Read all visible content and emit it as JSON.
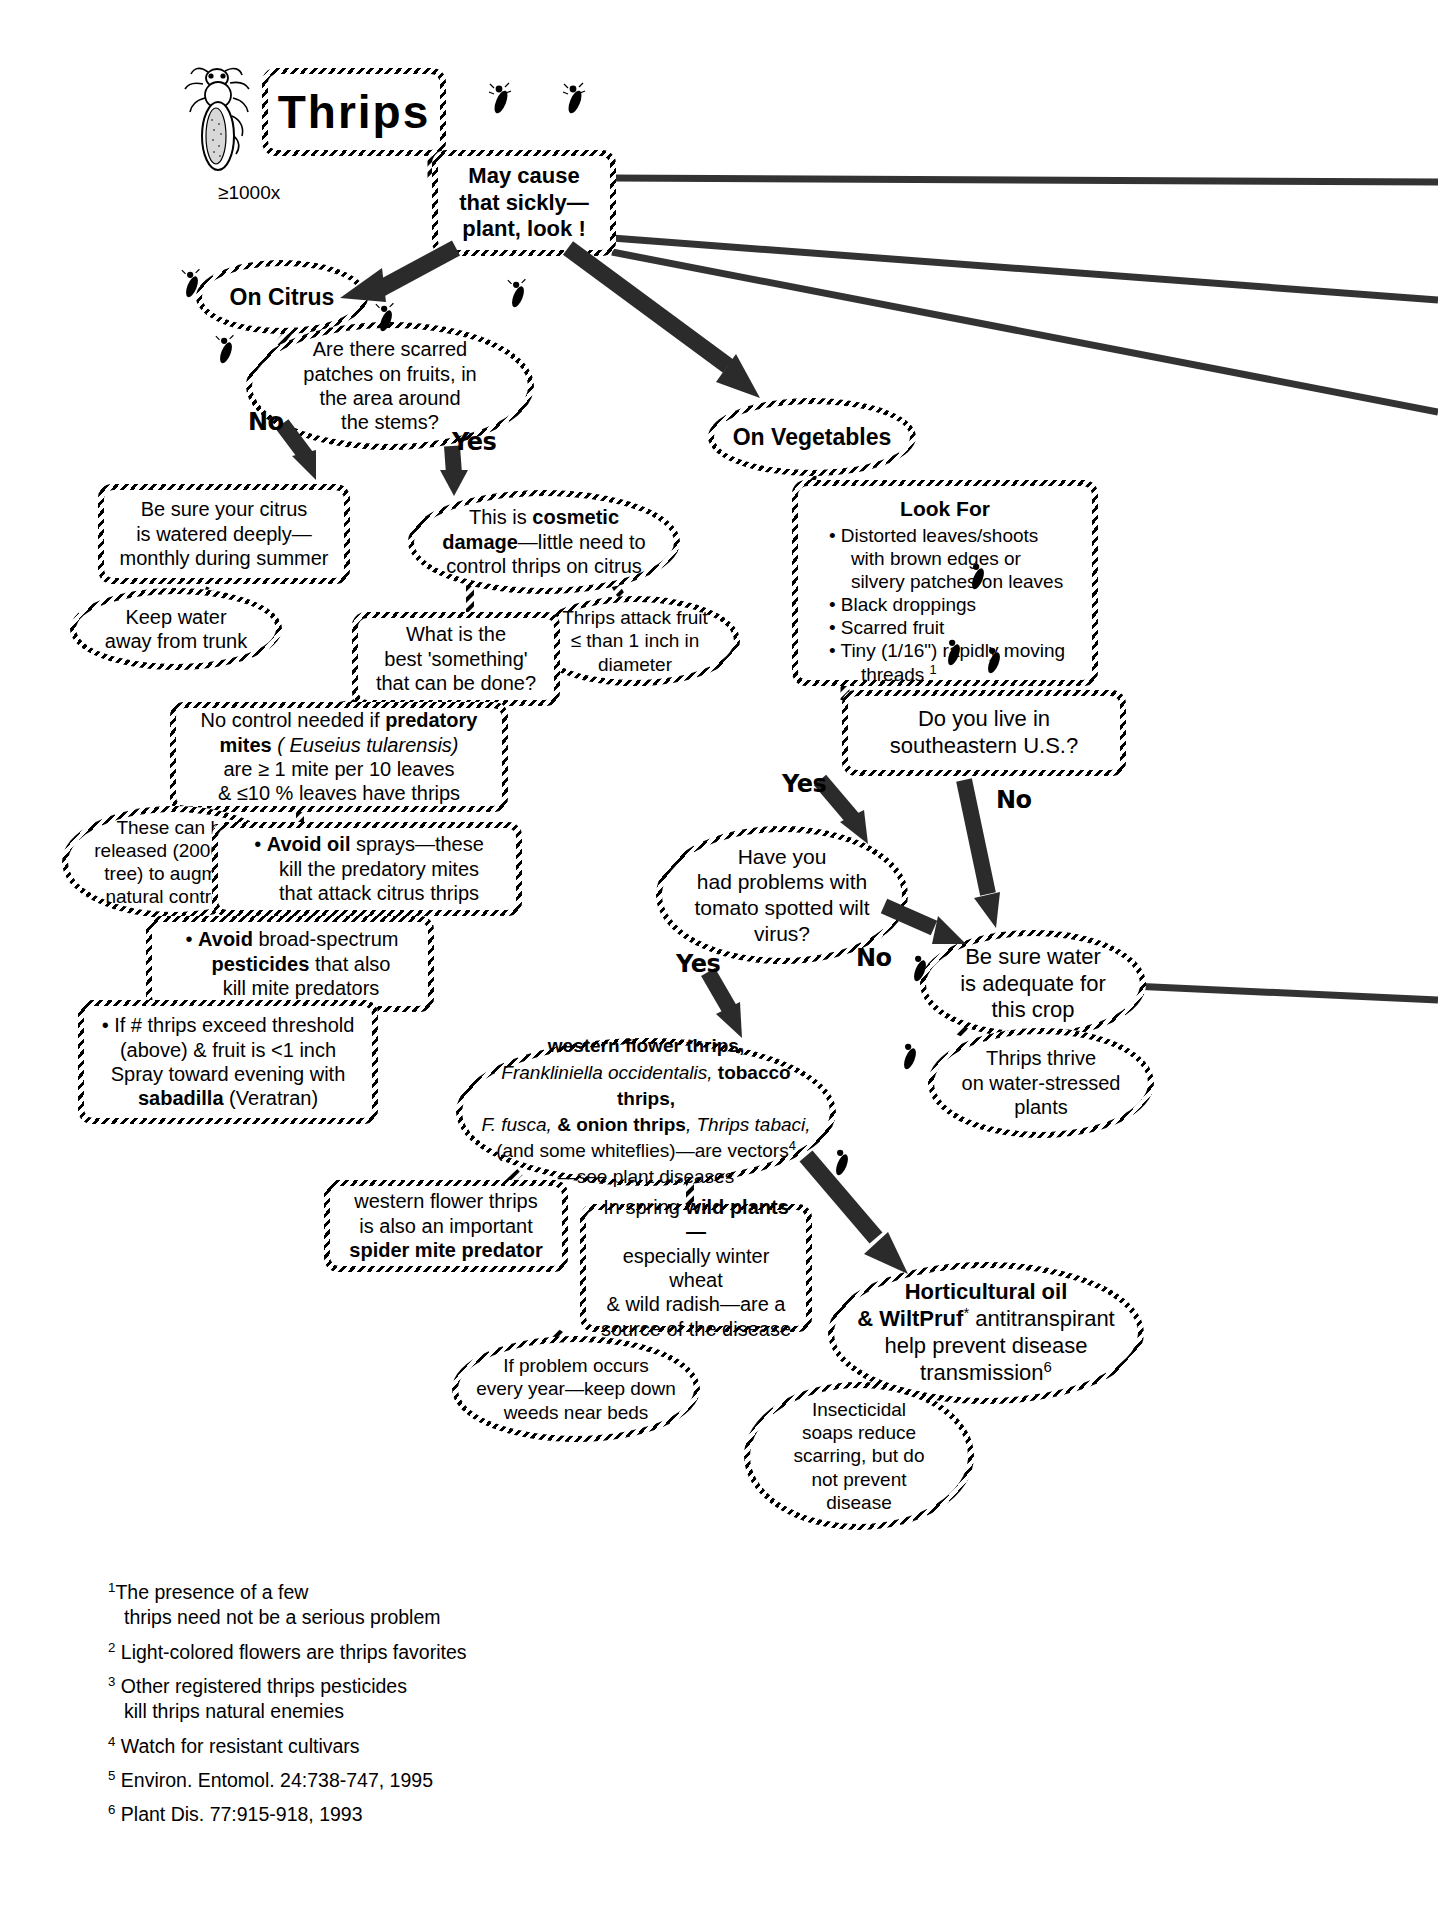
{
  "title": "Thrips",
  "magnification": "≥1000x",
  "nodes": {
    "intro": {
      "line1": "May cause",
      "line2": "that sickly—",
      "line3": "plant, look !"
    },
    "on_citrus": "On Citrus",
    "citrus_question": {
      "l1": "Are there scarred",
      "l2": "patches on  fruits, in",
      "l3": "the area around",
      "l4": "the stems?"
    },
    "citrus_no": {
      "l1": "Be sure your citrus",
      "l2": "is watered deeply—",
      "l3": "monthly during summer"
    },
    "keep_water": {
      "l1": "Keep water",
      "l2": "away from trunk"
    },
    "cosmetic": {
      "l1_a": "This is ",
      "l1_b": "cosmetic",
      "l2_a": "damage",
      "l2_b": "—little need to",
      "l3": "control thrips on citrus"
    },
    "thrips_attack_fruit": {
      "l1": "Thrips attack fruit",
      "l2": "≤ than 1 inch in",
      "l3": "diameter"
    },
    "best_something": {
      "l1": "What is the",
      "l2": "best 'something'",
      "l3": "that can be done?"
    },
    "predatory_mites": {
      "l1_a": "No control needed if ",
      "l1_b": "predatory",
      "l2_b": "mites",
      "l2_i": " ( Euseius tularensis)",
      "l3": "are ≥ 1 mite per 10 leaves",
      "l4": "& ≤10 % leaves have thrips"
    },
    "released": {
      "l1": "These can be",
      "l2": "released (2000 per",
      "l3": "tree) to augment",
      "l4": "natural controls",
      "sup": "5"
    },
    "avoid_oil": {
      "bullet": "•",
      "l1_b": "Avoid oil",
      "l1_a": " sprays—these",
      "l2": "kill the predatory mites",
      "l3": "that attack citrus thrips"
    },
    "avoid_broad": {
      "bullet": "•",
      "l1_b": "Avoid",
      "l1_a": " broad-spectrum",
      "l2_b": "pesticides",
      "l2_a": " that also",
      "l3": "kill mite predators"
    },
    "sabadilla": {
      "l1": "• If # thrips exceed threshold",
      "l2": "(above) & fruit is <1 inch",
      "l3": "Spray toward evening with",
      "l4_b": "sabadilla",
      "l4_a": " (Veratran)"
    },
    "on_vegetables": "On Vegetables",
    "look_for": {
      "heading": "Look For",
      "items": [
        {
          "l1": "Distorted leaves/shoots",
          "l2": "with brown edges or",
          "l3": "silvery patches on leaves"
        },
        {
          "l1": "Black droppings"
        },
        {
          "l1": "Scarred fruit"
        },
        {
          "l1": "Tiny (1/16\") rapidly moving",
          "l2": "threads ",
          "sup": "1"
        }
      ]
    },
    "southeast_question": {
      "l1": "Do you live in",
      "l2": "southeastern U.S.?"
    },
    "tswv_question": {
      "l1": "Have you",
      "l2": "had problems with",
      "l3": "tomato spotted wilt",
      "l4": "virus?"
    },
    "be_sure_water": {
      "l1": "Be sure water",
      "l2": "is adequate for",
      "l3": "this crop"
    },
    "thrips_thrive": {
      "l1": "Thrips thrive",
      "l2": "on water-stressed",
      "l3": "plants"
    },
    "vectors": {
      "l1_b": "western flower thrips,",
      "l2_i": "Frankliniella occidentalis,",
      "l2_b": " tobacco thrips,",
      "l3_i": "F. fusca,",
      "l3_b": " & onion thrips",
      "l3_i2": ", Thrips tabaci,",
      "l4": "(and some whiteflies)—are vectors",
      "l4_sup": "4",
      "l5": "—see plant diseases"
    },
    "spider_mite": {
      "l1": "western flower thrips",
      "l2": "is also an important",
      "l3_b": "spider mite predator"
    },
    "wild_plants": {
      "l1_a": "In spring ",
      "l1_b": "wild plants—",
      "l2": "especially winter wheat",
      "l3": "& wild radish—are a",
      "l4": "source of the disease"
    },
    "weeds": {
      "l1": "If problem occurs",
      "l2": "every year—keep down",
      "l3": "weeds near beds"
    },
    "hort_oil": {
      "l1_b": "Horticultural oil",
      "l2_b": "& WiltPruf",
      "l2_sup": "*",
      "l2_a": " antitranspirant",
      "l3": "help prevent disease",
      "l4": "transmission",
      "l4_sup": "6"
    },
    "soaps": {
      "l1": "Insecticidal",
      "l2": "soaps reduce",
      "l3": "scarring, but do",
      "l4": "not prevent",
      "l5": "disease"
    }
  },
  "edge_labels": {
    "citrus_no": "No",
    "citrus_yes": "Yes",
    "southeast_yes": "Yes",
    "southeast_no": "No",
    "tswv_yes": "Yes",
    "tswv_no": "No"
  },
  "footnotes": [
    {
      "num": "1",
      "l1": "The presence of a few",
      "l2": "thrips need not be a serious problem"
    },
    {
      "num": "2",
      "l1": " Light-colored flowers are thrips favorites"
    },
    {
      "num": "3",
      "l1": " Other registered thrips pesticides",
      "l2": "kill thrips natural enemies"
    },
    {
      "num": "4",
      "l1": " Watch for resistant cultivars"
    },
    {
      "num": "5",
      "l1": " Environ. Entomol. 24:738-747, 1995"
    },
    {
      "num": "6",
      "l1": " Plant Dis. 77:915-918, 1993"
    }
  ]
}
